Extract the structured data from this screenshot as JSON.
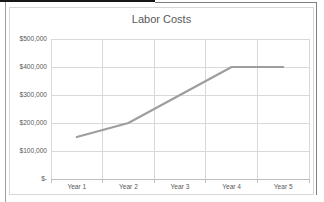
{
  "chart_data": {
    "type": "line",
    "title": "Labor Costs",
    "categories": [
      "Year 1",
      "Year 2",
      "Year 3",
      "Year 4",
      "Year 5"
    ],
    "values": [
      150000,
      200000,
      300000,
      400000,
      400000
    ],
    "xlabel": "",
    "ylabel": "",
    "ylim": [
      0,
      500000
    ],
    "ytick_interval": 100000,
    "ytick_labels": [
      "$-",
      "$100,000",
      "$200,000",
      "$300,000",
      "$400,000",
      "$500,000"
    ],
    "grid": true,
    "legend": "none",
    "colors": {
      "series_line": "#9e9e9e",
      "gridline": "#d9d9d9",
      "axis_line": "#bfbfbf",
      "text": "#595959",
      "chart_border": "#d7d7d7",
      "background": "#ffffff"
    }
  }
}
